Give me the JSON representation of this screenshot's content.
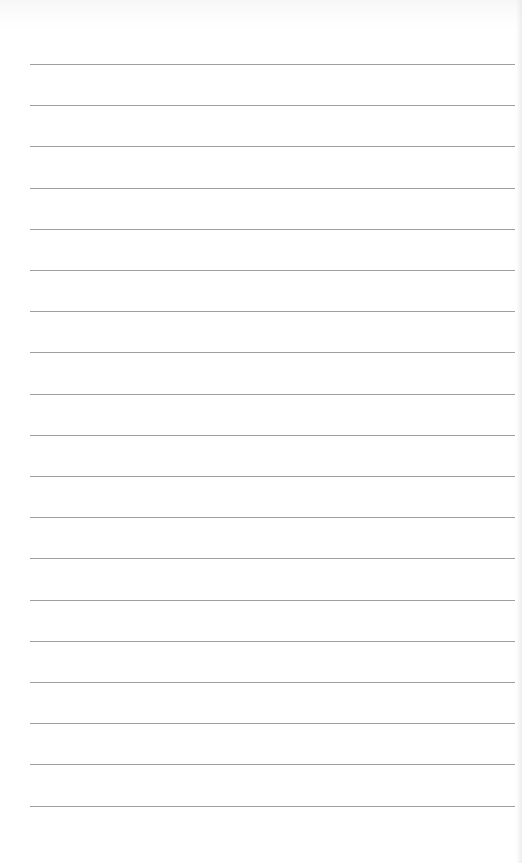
{
  "document": {
    "type": "lined-paper",
    "line_count": 19,
    "line_color": "#8e8e8e",
    "paper_color": "#ffffff",
    "lines": [
      {
        "text": ""
      },
      {
        "text": ""
      },
      {
        "text": ""
      },
      {
        "text": ""
      },
      {
        "text": ""
      },
      {
        "text": ""
      },
      {
        "text": ""
      },
      {
        "text": ""
      },
      {
        "text": ""
      },
      {
        "text": ""
      },
      {
        "text": ""
      },
      {
        "text": ""
      },
      {
        "text": ""
      },
      {
        "text": ""
      },
      {
        "text": ""
      },
      {
        "text": ""
      },
      {
        "text": ""
      },
      {
        "text": ""
      },
      {
        "text": ""
      }
    ]
  }
}
